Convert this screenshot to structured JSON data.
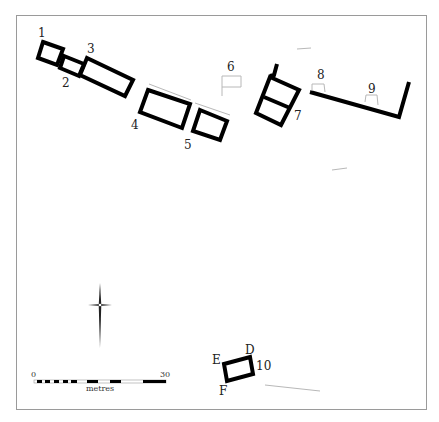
{
  "figure": {
    "type": "archaeological site plan",
    "frame_color": "#9a9a9a",
    "wall_color": "#000000",
    "faint_color": "#b8b8b8"
  },
  "structures": [
    {
      "id": "1",
      "label": "1"
    },
    {
      "id": "2",
      "label": "2"
    },
    {
      "id": "3",
      "label": "3"
    },
    {
      "id": "4",
      "label": "4"
    },
    {
      "id": "5",
      "label": "5"
    },
    {
      "id": "6",
      "label": "6"
    },
    {
      "id": "7",
      "label": "7"
    },
    {
      "id": "8",
      "label": "8"
    },
    {
      "id": "9",
      "label": "9"
    },
    {
      "id": "10",
      "label": "10"
    }
  ],
  "corner_labels": {
    "d": "D",
    "e": "E",
    "f": "F"
  },
  "scale_bar": {
    "start_label": "0",
    "end_label": "30",
    "unit_label": "metres"
  },
  "north_arrow": {
    "icon": "north-arrow-icon"
  }
}
